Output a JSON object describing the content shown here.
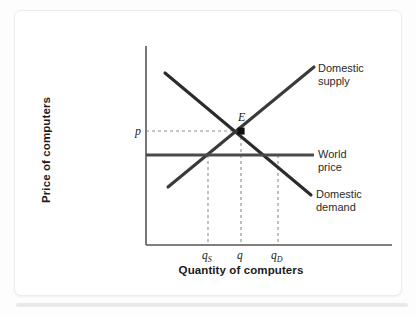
{
  "figure": {
    "kind": "supply-demand-diagram",
    "background_color": "#ffffff",
    "card_border_color": "#ececec"
  },
  "axes": {
    "y_title": "Price of computers",
    "x_title": "Quantity of computers",
    "axis_color": "#555555",
    "origin": {
      "x": 146,
      "y": 245
    },
    "x_end": 392,
    "y_top": 46
  },
  "ticks": {
    "x": [
      {
        "id": "qs",
        "base": "q",
        "sub": "S",
        "x": 208
      },
      {
        "id": "q",
        "base": "q",
        "sub": "",
        "x": 241
      },
      {
        "id": "qd",
        "base": "q",
        "sub": "D",
        "x": 278
      }
    ],
    "y": [
      {
        "id": "p",
        "label": "p",
        "y": 131
      }
    ]
  },
  "curves": [
    {
      "name": "domestic-supply",
      "label_line1": "Domestic",
      "label_line2": "supply",
      "color": "#3a3a3a",
      "width": 3,
      "x1": 168,
      "y1": 187,
      "x2": 314,
      "y2": 67
    },
    {
      "name": "domestic-demand",
      "label_line1": "Domestic",
      "label_line2": "demand",
      "color": "#2b2b2b",
      "width": 3,
      "x1": 165,
      "y1": 73,
      "x2": 311,
      "y2": 195
    },
    {
      "name": "world-price",
      "label_line1": "World",
      "label_line2": "price",
      "color": "#4a4a4a",
      "width": 3,
      "x1": 146,
      "y1": 155,
      "x2": 314,
      "y2": 155
    }
  ],
  "equilibrium": {
    "label": "E",
    "x": 241,
    "y": 131,
    "dot_color": "#111111",
    "dot_radius": 3.2
  },
  "guides": {
    "color": "#8c8c8c",
    "dash": "3,3",
    "horizontal": [
      {
        "name": "price-p-guide",
        "x1": 146,
        "x2": 241,
        "y": 131
      }
    ],
    "vertical": [
      {
        "name": "qs-guide",
        "x": 208,
        "y1": 155,
        "y2": 245
      },
      {
        "name": "q-guide",
        "x": 241,
        "y1": 131,
        "y2": 245
      },
      {
        "name": "qd-guide",
        "x": 278,
        "y1": 155,
        "y2": 245
      }
    ]
  }
}
